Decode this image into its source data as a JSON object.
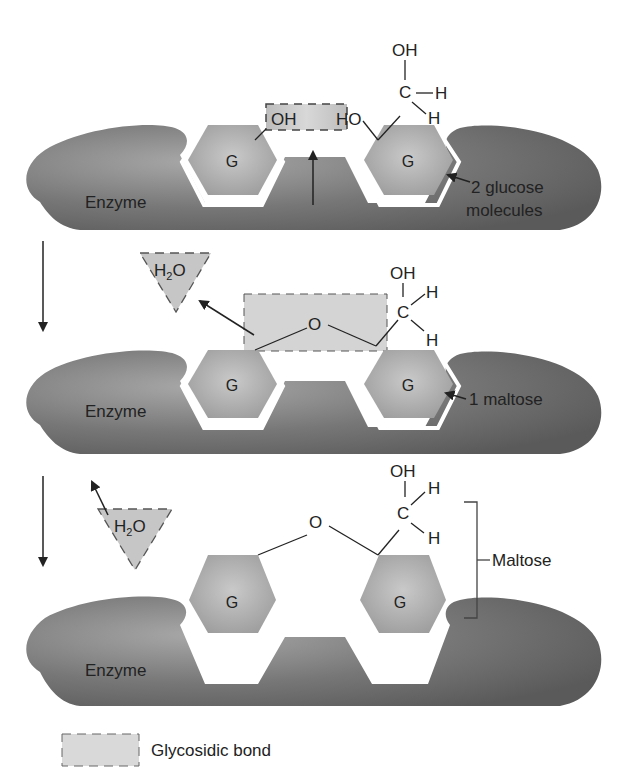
{
  "diagram": {
    "panels": [
      {
        "id": "step1",
        "enzyme_label": "Enzyme",
        "glucose_left": "G",
        "glucose_right": "G",
        "left_group": "OH",
        "right_group": "HO",
        "ch2oh": {
          "oh": "OH",
          "c": "C",
          "h1": "H",
          "h2": "H"
        },
        "callout": [
          "2 glucose",
          "molecules"
        ]
      },
      {
        "id": "step2",
        "enzyme_label": "Enzyme",
        "glucose_left": "G",
        "glucose_right": "G",
        "bridge_oxygen": "O",
        "water": "H2O",
        "water_display": {
          "h": "H",
          "sub": "2",
          "o": "O"
        },
        "ch2oh": {
          "oh": "OH",
          "c": "C",
          "h1": "H",
          "h2": "H"
        },
        "callout": "1 maltose"
      },
      {
        "id": "step3",
        "enzyme_label": "Enzyme",
        "glucose_left": "G",
        "glucose_right": "G",
        "bridge_oxygen": "O",
        "water": "H2O",
        "water_display": {
          "h": "H",
          "sub": "2",
          "o": "O"
        },
        "ch2oh": {
          "oh": "OH",
          "c": "C",
          "h1": "H",
          "h2": "H"
        },
        "bracket_label": "Maltose"
      }
    ],
    "legend": {
      "label": "Glycosidic bond"
    },
    "colors": {
      "enzyme": "#6e6e6e",
      "enzyme_highlight": "#a5a5a5",
      "glucose": "#b4b4b4",
      "bond_box": "#d6d6d6",
      "line": "#222222"
    }
  }
}
